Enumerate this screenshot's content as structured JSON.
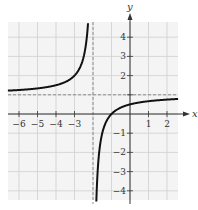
{
  "chart_data": {
    "type": "line",
    "title": "",
    "xlabel": "x",
    "ylabel": "y",
    "xlim": [
      -6.6,
      2.6
    ],
    "ylim": [
      -4.6,
      4.8
    ],
    "x_ticks": [
      -6,
      -5,
      -4,
      -3,
      1,
      2
    ],
    "y_ticks": [
      -4,
      -3,
      -2,
      -1,
      2,
      3,
      4
    ],
    "x_tick_labels": [
      "-6",
      "-5",
      "-4",
      "-3",
      "1",
      "2"
    ],
    "y_tick_labels": [
      "-4",
      "-3",
      "-2",
      "-1",
      "2",
      "3",
      "4"
    ],
    "grid": true,
    "asymptotes": {
      "vertical": {
        "x": -2,
        "style": "dashed"
      },
      "horizontal": {
        "y": 1,
        "style": "dashed"
      }
    },
    "series": [
      {
        "name": "f(x) = (x+1)/(x+2), left branch",
        "x": [
          -6.6,
          -6,
          -5,
          -4,
          -3,
          -2.5,
          -2.3,
          -2.2
        ],
        "values": [
          1.217,
          1.25,
          1.333,
          1.5,
          2,
          3,
          4.333,
          6
        ]
      },
      {
        "name": "f(x) = (x+1)/(x+2), right branch",
        "x": [
          -1.8,
          -1.6,
          -1.5,
          -1,
          0,
          1,
          2,
          2.6
        ],
        "values": [
          -4,
          -1.5,
          -1,
          0,
          0.5,
          0.667,
          0.75,
          0.783
        ]
      }
    ]
  }
}
